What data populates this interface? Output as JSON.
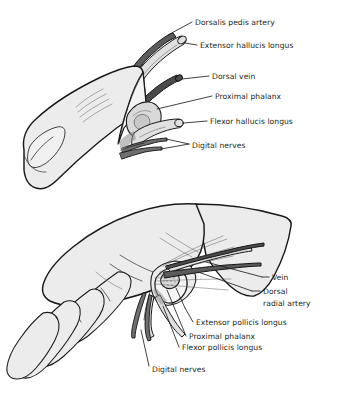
{
  "figure": {
    "background_color": "#ffffff",
    "ink_color": "#231f20",
    "skin_fill": "#ececec",
    "artery_fill": "#5c5c5c",
    "vein_fill": "#4a4a4a",
    "tendon_fill": "#e0e0e0",
    "bone_fill": "#d9d9d9",
    "nerve_fill": "#6f6f6f"
  },
  "panels": [
    {
      "id": "great-toe",
      "name": "great-toe-dissection",
      "labels": [
        {
          "id": "dorsalis-pedis-artery",
          "text": "Dorsalis pedis artery",
          "x": 195,
          "y": 25
        },
        {
          "id": "extensor-hallucis-longus",
          "text": "Extensor hallucis longus",
          "x": 200,
          "y": 48
        },
        {
          "id": "dorsal-vein",
          "text": "Dorsal vein",
          "x": 212,
          "y": 79
        },
        {
          "id": "proximal-phalanx",
          "text": "Proximal phalanx",
          "x": 215,
          "y": 99
        },
        {
          "id": "flexor-hallucis-longus",
          "text": "Flexor hallucis longus",
          "x": 210,
          "y": 124
        },
        {
          "id": "digital-nerves",
          "text": "Digital nerves",
          "x": 192,
          "y": 145
        }
      ]
    },
    {
      "id": "thumb",
      "name": "thumb-dissection",
      "labels": [
        {
          "id": "vein",
          "text": "Vein",
          "x": 272,
          "y": 280
        },
        {
          "id": "dorsal",
          "text": "Dorsal",
          "x": 263,
          "y": 294
        },
        {
          "id": "radial-artery",
          "text": "radial artery",
          "x": 263,
          "y": 306
        },
        {
          "id": "extensor-pollicis-longus",
          "text": "Extensor pollicis longus",
          "x": 196,
          "y": 325
        },
        {
          "id": "proximal-phalanx-hand",
          "text": "Proximal phalanx",
          "x": 189,
          "y": 339
        },
        {
          "id": "flexor-pollicis-longus",
          "text": "Flexor pollicis longus",
          "x": 182,
          "y": 350
        },
        {
          "id": "digital-nerves-hand",
          "text": "Digital nerves",
          "x": 152,
          "y": 369
        }
      ]
    }
  ]
}
